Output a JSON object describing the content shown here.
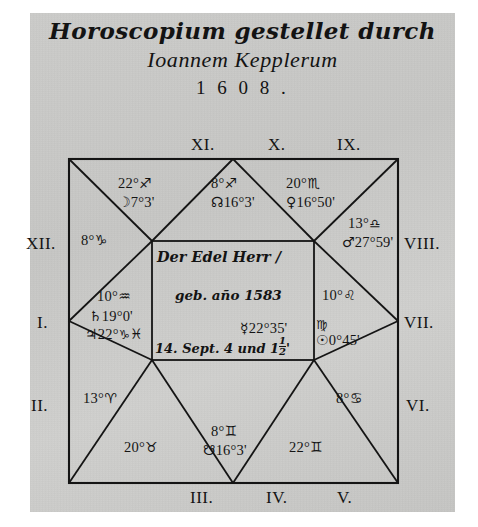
{
  "title": {
    "line1": "Horoscopium gestellet durch",
    "line2": "Ioannem Kepplerum",
    "line3": "1 6 0 8 ."
  },
  "chart": {
    "type": "square-horoscope",
    "house_labels": [
      {
        "id": "I",
        "text": "I."
      },
      {
        "id": "II",
        "text": "II."
      },
      {
        "id": "III",
        "text": "III."
      },
      {
        "id": "IV",
        "text": "IV."
      },
      {
        "id": "V",
        "text": "V."
      },
      {
        "id": "VI",
        "text": "VI."
      },
      {
        "id": "VII",
        "text": "VII."
      },
      {
        "id": "VIII",
        "text": "VIII."
      },
      {
        "id": "IX",
        "text": "IX."
      },
      {
        "id": "X",
        "text": "X."
      },
      {
        "id": "XI",
        "text": "XI."
      },
      {
        "id": "XII",
        "text": "XII."
      }
    ],
    "cusps": {
      "I": {
        "degree": "10°",
        "sign_glyph": "♒",
        "sign_name": "Aquarius"
      },
      "II": {
        "degree": "13°",
        "sign_glyph": "♈",
        "sign_name": "Aries"
      },
      "III": {
        "degree": "20°",
        "sign_glyph": "♉",
        "sign_name": "Taurus"
      },
      "IV": {
        "degree": "8°",
        "sign_glyph": "♊",
        "sign_name": "Gemini"
      },
      "V": {
        "degree": "22°",
        "sign_glyph": "♊",
        "sign_name": "Gemini"
      },
      "VI": {
        "degree": "8°",
        "sign_glyph": "♋",
        "sign_name": "Cancer"
      },
      "VII": {
        "degree": "10°",
        "sign_glyph": "♌",
        "sign_name": "Leo"
      },
      "VIII": {
        "degree": "13°",
        "sign_glyph": "♎",
        "sign_name": "Libra"
      },
      "IX": {
        "degree": "20°",
        "sign_glyph": "♏",
        "sign_name": "Scorpio"
      },
      "X": {
        "degree": "8°",
        "sign_glyph": "♐",
        "sign_name": "Sagittarius"
      },
      "XI": {
        "degree": "22°",
        "sign_glyph": "♐",
        "sign_name": "Sagittarius"
      },
      "XII": {
        "degree": "8°",
        "sign_glyph": "♑",
        "sign_name": "Capricorn"
      }
    },
    "planets": {
      "moon": {
        "glyph": "☽",
        "name": "Moon",
        "position": "7°3'",
        "house": "XI"
      },
      "north_node": {
        "glyph": "☊",
        "name": "North Node",
        "position": "16°3'",
        "house": "X"
      },
      "venus": {
        "glyph": "♀",
        "name": "Venus",
        "position": "16°50'",
        "house": "IX"
      },
      "mars": {
        "glyph": "♂",
        "name": "Mars",
        "position": "27°59'",
        "house": "VIII"
      },
      "saturn": {
        "glyph": "♄",
        "name": "Saturn",
        "position": "19°0'",
        "house": "I"
      },
      "jupiter": {
        "glyph": "♃",
        "name": "Jupiter",
        "position": "22°",
        "sign_glyph": "♑",
        "house": "I"
      },
      "pisces_mark": {
        "glyph": "♓",
        "name": "Pisces",
        "house": "I"
      },
      "mercury": {
        "glyph": "☿",
        "name": "Mercury",
        "position": "22°35'",
        "house": "center"
      },
      "sun": {
        "glyph": "☉",
        "name": "Sun",
        "position": "0°45'",
        "sign_glyph": "♍",
        "sign_name": "Virgo",
        "house": "VII"
      },
      "south_node": {
        "glyph": "☋",
        "name": "South Node",
        "position": "16°3'",
        "house": "IV"
      }
    },
    "center": {
      "line1": "Der Edel Herr /",
      "line2": "geb. año 1583",
      "line3_prefix": "14. Sept. 4 und 1",
      "line3_frac_num": "1",
      "line3_frac_den": "2",
      "line3_suffix": "'"
    }
  },
  "colors": {
    "paper": "#c9c9c7",
    "ink": "#141414",
    "margin": "#ffffff"
  }
}
